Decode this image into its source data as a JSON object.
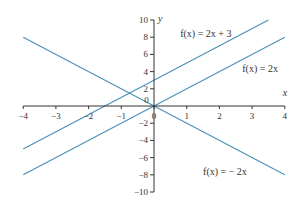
{
  "chart_data": {
    "type": "line",
    "title": "",
    "xlabel": "x",
    "ylabel": "y",
    "xlim": [
      -4,
      4
    ],
    "ylim": [
      -10,
      10
    ],
    "grid": false,
    "x_ticks": [
      -4,
      -3,
      -2,
      -1,
      0,
      1,
      2,
      3,
      4
    ],
    "y_ticks": [
      -10,
      -8,
      -6,
      -4,
      -2,
      0,
      2,
      4,
      6,
      8,
      10
    ],
    "series": [
      {
        "name": "f(x) = 2x + 3",
        "x": [
          -4,
          3.5
        ],
        "values": [
          -5,
          10
        ]
      },
      {
        "name": "f(x) = 2x",
        "x": [
          -4,
          4
        ],
        "values": [
          -8,
          8
        ]
      },
      {
        "name": "f(x) = − 2x",
        "x": [
          -4,
          4
        ],
        "values": [
          8,
          -8
        ]
      }
    ],
    "annotations": [
      {
        "text": "f(x) = 2x + 3",
        "x": 0.8,
        "y": 8
      },
      {
        "text": "f(x) = 2x",
        "x": 2.7,
        "y": 4
      },
      {
        "text": "f(x) = − 2x",
        "x": 1.5,
        "y": -8
      },
      {
        "text": "0",
        "x": -0.3,
        "y": 0.3
      }
    ],
    "line_color": "#4a90b8"
  }
}
